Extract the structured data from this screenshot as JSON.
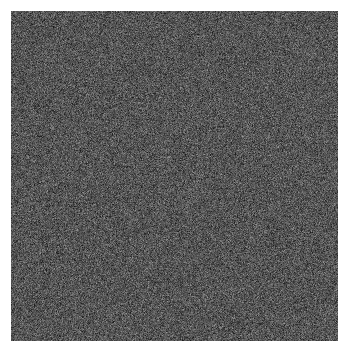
{
  "figure": {
    "width": 350,
    "height": 353,
    "background_color": "#ffffff",
    "margin_left": 11,
    "margin_top": 11,
    "margin_right": 12,
    "margin_bottom": 12
  },
  "chart_data": {
    "type": "heatmap",
    "title": "",
    "subtitle": "",
    "xlabel": "",
    "ylabel": "",
    "legend": [],
    "annotations": [],
    "axis_visible": false,
    "ticks_visible": false,
    "grid": false,
    "colorbar": false,
    "colormap": "gray",
    "plot_area": {
      "x": 11,
      "y": 11,
      "width": 327,
      "height": 330
    },
    "pixel_grid": {
      "columns": 327,
      "rows": 330
    },
    "value_range": [
      0,
      255
    ],
    "observed_min_gray": 26,
    "observed_max_gray": 154,
    "mean_gray": 85,
    "std_gray": 22,
    "mean_color": "#555555",
    "darkest_color": "#1a1a1a",
    "lightest_color": "#9a9a9a",
    "distribution": "gaussian",
    "random_seed": 20240517
  }
}
